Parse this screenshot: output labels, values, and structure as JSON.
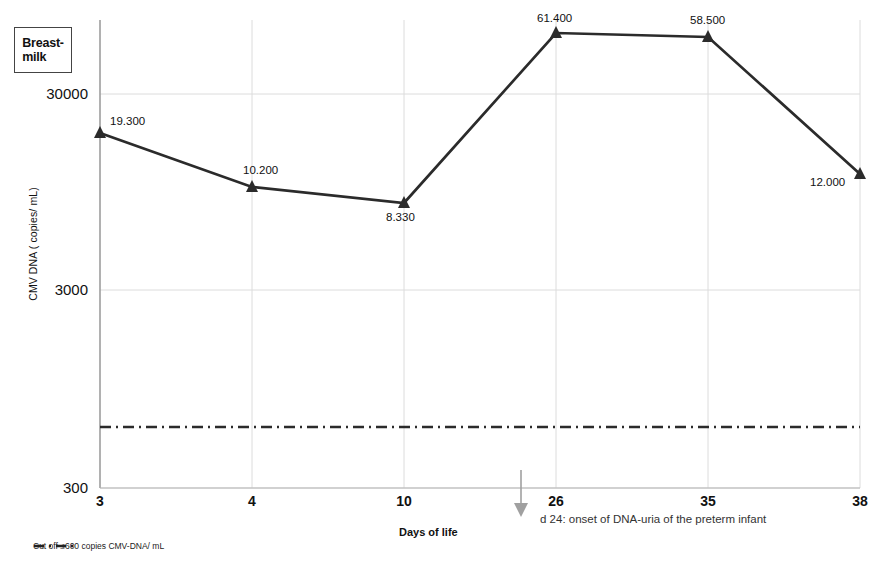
{
  "chart_data": {
    "type": "line",
    "title": "",
    "series_label": "Breast-milk",
    "xlabel": "Days of life",
    "ylabel": "CMV  DNA ( copies/ mL)",
    "scale": "log",
    "grid": true,
    "categories": [
      "3",
      "4",
      "10",
      "26",
      "35",
      "38"
    ],
    "x": [
      3,
      4,
      10,
      26,
      35,
      38
    ],
    "values": [
      19300,
      10200,
      8330,
      61400,
      58500,
      12000
    ],
    "point_labels": [
      "19.300",
      "10.200",
      "8.330",
      "61.400",
      "58.500",
      "12.000"
    ],
    "ytick_labels": [
      "30000",
      "3000",
      "300"
    ],
    "ytick_values": [
      30000,
      3000,
      300
    ],
    "ylim": [
      300,
      100000
    ],
    "cutoff": {
      "value": 600,
      "label": "Cut off ≤600 copies CMV-DNA/ mL",
      "style": "dash-dot"
    },
    "annotation": {
      "text": "d 24: onset of DNA-uria of the preterm infant",
      "arrow_at_day": 24
    },
    "colors": {
      "line": "#2b2b2b",
      "marker": "#2b2b2b",
      "grid": "#d9d9d9",
      "axis": "#8c8c8c",
      "arrow": "#9a9a9a",
      "text": "#111111"
    },
    "legend_position": "top-left"
  }
}
